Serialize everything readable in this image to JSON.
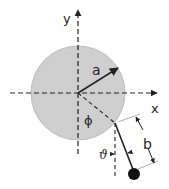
{
  "diagram": {
    "labels": {
      "x_axis": "x",
      "y_axis": "y",
      "radius": "a",
      "angle_phi": "ϕ",
      "angle_theta": "ϑ",
      "length": "b"
    },
    "colors": {
      "disk_fill": "#cfcfcf",
      "disk_stroke": "#bdbdbd",
      "line": "#222222",
      "bob": "#111111",
      "dim_line": "#999999"
    }
  }
}
